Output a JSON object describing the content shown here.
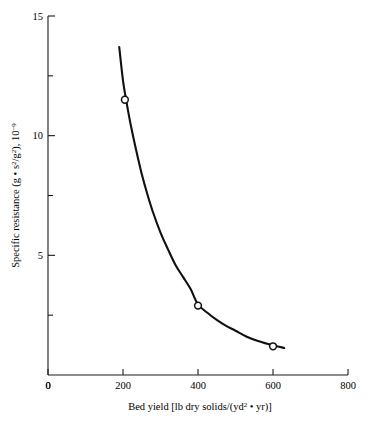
{
  "figure": {
    "background": "#ffffff",
    "line_color": "#111111",
    "marker_fill": "#ffffff",
    "marker_stroke": "#111111"
  },
  "chart_data": {
    "type": "line",
    "title": "",
    "subtitle": "",
    "xlabel_parts": {
      "lead": "Bed yield [lb dry solids/(yd",
      "sup": "2",
      "tail": " • yr)]"
    },
    "xlabel": "Bed yield [lb dry solids/(yd2 • yr)]",
    "ylabel_parts": {
      "lead": "Specific resistance (g • s",
      "sup1": "2",
      "mid": "/g",
      "sup2": "2",
      "tail": "), 10",
      "sup3": "−9"
    },
    "ylabel": "Specific resistance (g • s2/g2), 10-9",
    "xlim": [
      0,
      800
    ],
    "ylim": [
      0,
      15
    ],
    "grid": false,
    "legend": null,
    "xticks": [
      0,
      200,
      400,
      600,
      800
    ],
    "xtick_labels": [
      "0",
      "200",
      "400",
      "600",
      "800"
    ],
    "xminor_ticks": [
      100,
      300,
      500,
      700
    ],
    "yticks": [
      5,
      10,
      15
    ],
    "ytick_labels": [
      "5",
      "10",
      "15"
    ],
    "yminor_ticks": [
      2.5,
      7.5,
      12.5
    ],
    "series": [
      {
        "name": "specific resistance",
        "marker": "open-circle",
        "x": [
          205,
          400,
          600
        ],
        "y": [
          11.5,
          2.9,
          1.2
        ]
      }
    ],
    "curve": {
      "name": "fitted curve",
      "x": [
        190,
        200,
        210,
        220,
        235,
        250,
        265,
        280,
        300,
        320,
        340,
        360,
        380,
        400,
        425,
        450,
        475,
        500,
        530,
        560,
        590,
        610,
        630
      ],
      "y": [
        13.7,
        12.3,
        11.35,
        10.5,
        9.4,
        8.4,
        7.55,
        6.8,
        5.95,
        5.25,
        4.6,
        4.1,
        3.6,
        2.95,
        2.6,
        2.3,
        2.05,
        1.85,
        1.6,
        1.42,
        1.28,
        1.2,
        1.13
      ]
    }
  }
}
